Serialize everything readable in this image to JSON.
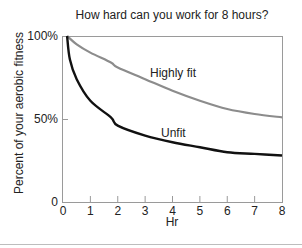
{
  "chart_data": {
    "type": "line",
    "title": "How hard can you work for 8 hours?",
    "xlabel": "Hr",
    "ylabel": "Percent of your aerobic fitness",
    "xlim": [
      0,
      8
    ],
    "ylim": [
      0,
      100
    ],
    "x_ticks": [
      "0",
      "1",
      "2",
      "3",
      "4",
      "5",
      "6",
      "7",
      "8"
    ],
    "y_ticks": [
      "0",
      "50%",
      "100%"
    ],
    "grid": false,
    "legend": "inline labels",
    "series": [
      {
        "name": "Highly fit",
        "color": "#8c8c8c",
        "x": [
          0.15,
          0.5,
          1,
          1.75,
          2,
          3,
          4,
          5,
          6,
          7,
          8
        ],
        "y": [
          100,
          95,
          90,
          84,
          81,
          74,
          67,
          61,
          56,
          53,
          51
        ]
      },
      {
        "name": "Unfit",
        "color": "#111111",
        "x": [
          0.15,
          0.25,
          0.5,
          1,
          1.75,
          2,
          3,
          4,
          5,
          6,
          7,
          8
        ],
        "y": [
          100,
          86,
          74,
          61,
          51,
          46,
          40,
          36,
          33,
          30,
          29,
          28
        ]
      }
    ]
  }
}
